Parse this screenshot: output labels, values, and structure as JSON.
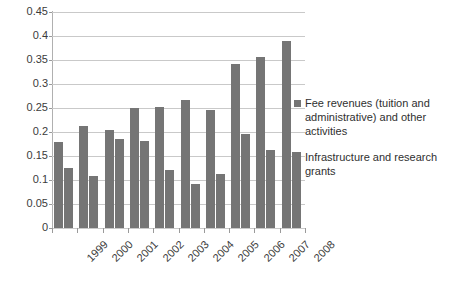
{
  "chart_data": {
    "type": "bar",
    "title": "",
    "xlabel": "",
    "ylabel": "",
    "categories": [
      "1999",
      "2000",
      "2001",
      "2002",
      "2003",
      "2004",
      "2005",
      "2006",
      "2007",
      "2008"
    ],
    "series": [
      {
        "name": "Fee revenues (tuition and administrative) and other activities",
        "values": [
          0.18,
          0.212,
          0.204,
          0.25,
          0.253,
          0.266,
          0.245,
          0.341,
          0.356,
          0.389
        ]
      },
      {
        "name": "Infrastructure and research grants",
        "values": [
          0.126,
          0.108,
          0.185,
          0.182,
          0.121,
          0.091,
          0.112,
          0.195,
          0.162,
          0.158
        ]
      }
    ],
    "ylim": [
      0,
      0.45
    ],
    "ytick_values": [
      0,
      0.05,
      0.1,
      0.15,
      0.2,
      0.25,
      0.3,
      0.35,
      0.4,
      0.45
    ],
    "ytick_labels": [
      "0",
      "0.05",
      "0.1",
      "0.15",
      "0.2",
      "0.25",
      "0.3",
      "0.35",
      "0.4",
      "0.45"
    ],
    "grid": true,
    "grid_axis": "y",
    "legend_position": "right",
    "bar_color": "#757575",
    "gridline_color": "#c9c9c9",
    "axis_color": "#8f8f8f",
    "text_color": "#3b3b3b",
    "background": "#ffffff"
  },
  "legend": {
    "entries": [
      {
        "label": "Fee revenues (tuition and administrative) and other activities",
        "color": "#757575",
        "marker": "square-marker-icon"
      },
      {
        "label": "Infrastructure and research grants",
        "color": "#757575",
        "marker": "square-marker-icon"
      }
    ]
  }
}
